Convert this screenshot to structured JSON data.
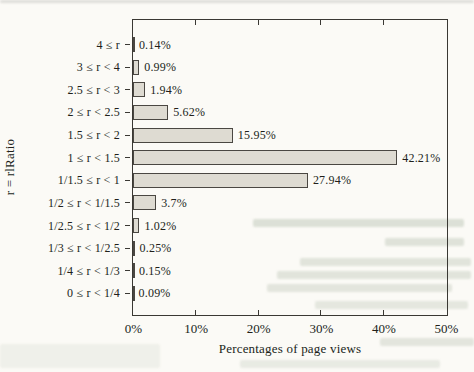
{
  "figure": {
    "background_color": "#fbfaf6",
    "frame_color": "#3a3833",
    "bar_fill_color": "#dedbd2",
    "bar_border_color": "#4a4742",
    "text_color": "#211f1a"
  },
  "chart_data": {
    "type": "bar",
    "orientation": "horizontal",
    "title": "",
    "xlabel": "Percentages of page views",
    "ylabel": "r = rlRatio",
    "xlim": [
      0,
      50
    ],
    "grid": false,
    "legend": "none",
    "categories": [
      "4 ≤ r",
      "3 ≤ r < 4",
      "2.5 ≤ r < 3",
      "2 ≤ r < 2.5",
      "1.5 ≤ r < 2",
      "1 ≤ r < 1.5",
      "1/1.5 ≤ r < 1",
      "1/2 ≤ r < 1/1.5",
      "1/2.5 ≤ r < 1/2",
      "1/3 ≤ r < 1/2.5",
      "1/4 ≤ r < 1/3",
      "0 ≤ r < 1/4"
    ],
    "values": [
      0.14,
      0.99,
      1.94,
      5.62,
      15.95,
      42.21,
      27.94,
      3.7,
      1.02,
      0.25,
      0.15,
      0.09
    ],
    "value_labels": [
      "0.14%",
      "0.99%",
      "1.94%",
      "5.62%",
      "15.95%",
      "42.21%",
      "27.94%",
      "3.7%",
      "1.02%",
      "0.25%",
      "0.15%",
      "0.09%"
    ],
    "x_tick_values": [
      0,
      10,
      20,
      30,
      40,
      50
    ],
    "x_tick_labels": [
      "0%",
      "10%",
      "20%",
      "30%",
      "40%",
      "50%"
    ]
  }
}
